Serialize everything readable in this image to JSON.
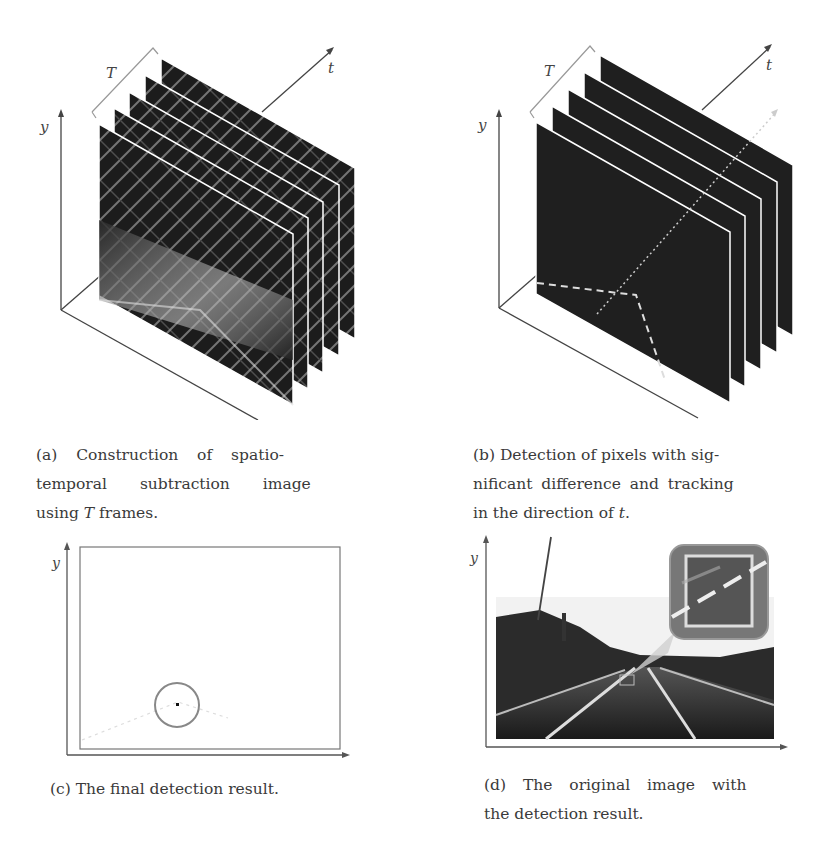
{
  "figure": {
    "panels": [
      {
        "id": "a",
        "label": "(a)",
        "caption_lines": [
          "(a) Construction of spatio-",
          "temporal subtraction image",
          "using "
        ],
        "caption_tail_var": "T",
        "caption_tail": " frames.",
        "axes": {
          "x": "x",
          "y": "y",
          "t": "t"
        },
        "bracket_label": "T",
        "frame_count": 5,
        "content": "edge-detected road scene frames"
      },
      {
        "id": "b",
        "label": "(b)",
        "caption_lines": [
          "(b) Detection of pixels with sig-",
          "nificant difference and tracking",
          "in the direction of "
        ],
        "caption_tail_var": "t",
        "caption_tail": ".",
        "axes": {
          "x": "x",
          "y": "y",
          "t": "t"
        },
        "bracket_label": "T",
        "frame_count": 5,
        "content": "dark frames with dashed lane lines and dotted tracking line"
      },
      {
        "id": "c",
        "label": "(c)",
        "caption_lines": [
          "(c) The final detection result."
        ],
        "axes": {
          "x": "x",
          "y": "y"
        },
        "content": "white frame with circled detection point"
      },
      {
        "id": "d",
        "label": "(d)",
        "caption_lines": [
          "(d) The original image with",
          "the detection result."
        ],
        "axes": {
          "x": "x",
          "y": "y"
        },
        "content": "road photograph with magnified callout of detection box"
      }
    ]
  }
}
